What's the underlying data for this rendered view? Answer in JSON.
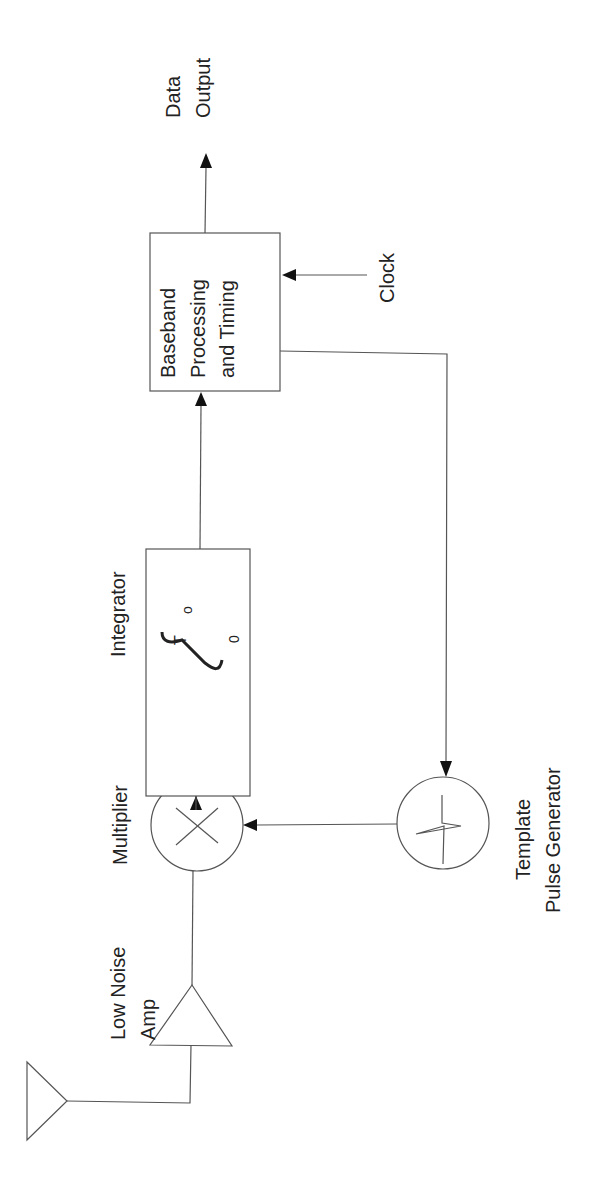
{
  "diagram": {
    "orientation": "rotated 90 degrees counter-clockwise",
    "blocks": {
      "antenna": {
        "label": ""
      },
      "lna": {
        "label_line1": "Low Noise",
        "label_line2": "Amp"
      },
      "multiplier": {
        "label": "Multiplier",
        "symbol": "×"
      },
      "integrator": {
        "label": "Integrator",
        "upper_limit": "T",
        "upper_limit_sub": "o",
        "lower_limit": "0"
      },
      "baseband": {
        "label_line1": "Baseband",
        "label_line2": "Processing",
        "label_line3": "and Timing"
      },
      "template": {
        "label_line1": "Template",
        "label_line2": "Pulse Generator"
      }
    },
    "inputs": {
      "clock": "Clock"
    },
    "outputs": {
      "data_line1": "Data",
      "data_line2": "Output"
    },
    "connections": [
      {
        "from": "antenna",
        "to": "lna"
      },
      {
        "from": "lna",
        "to": "multiplier"
      },
      {
        "from": "multiplier",
        "to": "integrator"
      },
      {
        "from": "integrator",
        "to": "baseband"
      },
      {
        "from": "clock",
        "to": "baseband"
      },
      {
        "from": "baseband",
        "to": "data-output"
      },
      {
        "from": "baseband",
        "to": "template"
      },
      {
        "from": "template",
        "to": "multiplier"
      }
    ],
    "colors": {
      "line": "#555555",
      "arrowhead": "#111111",
      "text": "#222222",
      "background": "#ffffff"
    }
  }
}
